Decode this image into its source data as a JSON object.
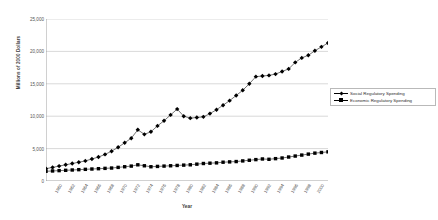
{
  "chart_data": {
    "type": "line",
    "title": "",
    "xlabel": "Year",
    "ylabel": "Millions of 2000 Dollars",
    "ylim": [
      0,
      25000
    ],
    "yticks": [
      0,
      5000,
      10000,
      15000,
      20000,
      25000
    ],
    "ytick_labels": [
      "0",
      "5,000",
      "10,000",
      "15,000",
      "20,000",
      "25,000"
    ],
    "grid": true,
    "legend_position": "right",
    "categories": [
      "1960",
      "1961",
      "1962",
      "1963",
      "1964",
      "1965",
      "1966",
      "1967",
      "1968",
      "1969",
      "1970",
      "1971",
      "1972",
      "1973",
      "1974",
      "1975",
      "1976",
      "1977",
      "1978",
      "1979",
      "1980",
      "1981",
      "1982",
      "1983",
      "1984",
      "1985",
      "1986",
      "1987",
      "1988",
      "1989",
      "1990",
      "1991",
      "1992",
      "1993",
      "1994",
      "1995",
      "1996",
      "1997",
      "1998",
      "1999",
      "2000",
      "2001",
      "2002",
      "2003"
    ],
    "xtick_labels": [
      "1960",
      "1962",
      "1964",
      "1966",
      "1968",
      "1970",
      "1972",
      "1974",
      "1976",
      "1978",
      "1980",
      "1982",
      "1984",
      "1986",
      "1988",
      "1990",
      "1992",
      "1994",
      "1996",
      "1998",
      "2000"
    ],
    "series": [
      {
        "name": "Social Regulatory Spending",
        "marker": "diamond",
        "color": "#000000",
        "values": [
          1900,
          2100,
          2300,
          2500,
          2700,
          2900,
          3100,
          3400,
          3700,
          4100,
          4600,
          5200,
          5900,
          6600,
          7900,
          7200,
          7600,
          8500,
          9300,
          10200,
          11100,
          10000,
          9700,
          9800,
          9900,
          10400,
          11000,
          11700,
          12400,
          13200,
          14000,
          15000,
          16100,
          16200,
          16300,
          16500,
          16900,
          17300,
          18300,
          19000,
          19400,
          20100,
          20700,
          21300
        ]
      },
      {
        "name": "Economic Regulatory Spending",
        "marker": "square",
        "color": "#000000",
        "values": [
          1500,
          1550,
          1600,
          1650,
          1700,
          1750,
          1800,
          1850,
          1900,
          1950,
          2000,
          2100,
          2200,
          2300,
          2500,
          2350,
          2200,
          2250,
          2300,
          2350,
          2400,
          2450,
          2500,
          2600,
          2700,
          2750,
          2800,
          2900,
          2950,
          3000,
          3100,
          3200,
          3300,
          3400,
          3350,
          3450,
          3550,
          3700,
          3850,
          4000,
          4150,
          4300,
          4400,
          4500
        ]
      }
    ]
  }
}
